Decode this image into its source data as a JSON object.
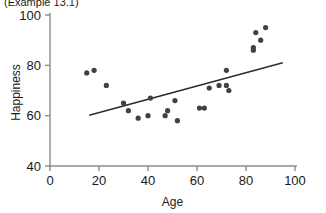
{
  "caption": {
    "text": "(Example 13.1)"
  },
  "chart_data": {
    "type": "scatter",
    "title": "",
    "xlabel": "Age",
    "ylabel": "Happiness",
    "xlim": [
      0,
      100
    ],
    "ylim": [
      40,
      100
    ],
    "xticks": [
      0,
      20,
      40,
      60,
      80,
      100
    ],
    "yticks": [
      40,
      60,
      80,
      100
    ],
    "grid": false,
    "legend": null,
    "point_color": "#414141",
    "line_color": "#2b2b2b",
    "axis_color": "#8c8c8c",
    "background": "#ffffff",
    "points": [
      {
        "x": 15,
        "y": 77
      },
      {
        "x": 18,
        "y": 78
      },
      {
        "x": 23,
        "y": 72
      },
      {
        "x": 30,
        "y": 65
      },
      {
        "x": 32,
        "y": 62
      },
      {
        "x": 36,
        "y": 59
      },
      {
        "x": 40,
        "y": 60
      },
      {
        "x": 41,
        "y": 67
      },
      {
        "x": 47,
        "y": 60
      },
      {
        "x": 48,
        "y": 62
      },
      {
        "x": 51,
        "y": 66
      },
      {
        "x": 52,
        "y": 58
      },
      {
        "x": 61,
        "y": 63
      },
      {
        "x": 63,
        "y": 63
      },
      {
        "x": 65,
        "y": 71
      },
      {
        "x": 69,
        "y": 72
      },
      {
        "x": 72,
        "y": 78
      },
      {
        "x": 72,
        "y": 72
      },
      {
        "x": 73,
        "y": 70
      },
      {
        "x": 83,
        "y": 86
      },
      {
        "x": 83,
        "y": 87
      },
      {
        "x": 84,
        "y": 93
      },
      {
        "x": 86,
        "y": 90
      },
      {
        "x": 88,
        "y": 95
      }
    ],
    "trendline": {
      "x_start": 16,
      "y_start": 60.2,
      "x_end": 95,
      "y_end": 81.0
    }
  }
}
